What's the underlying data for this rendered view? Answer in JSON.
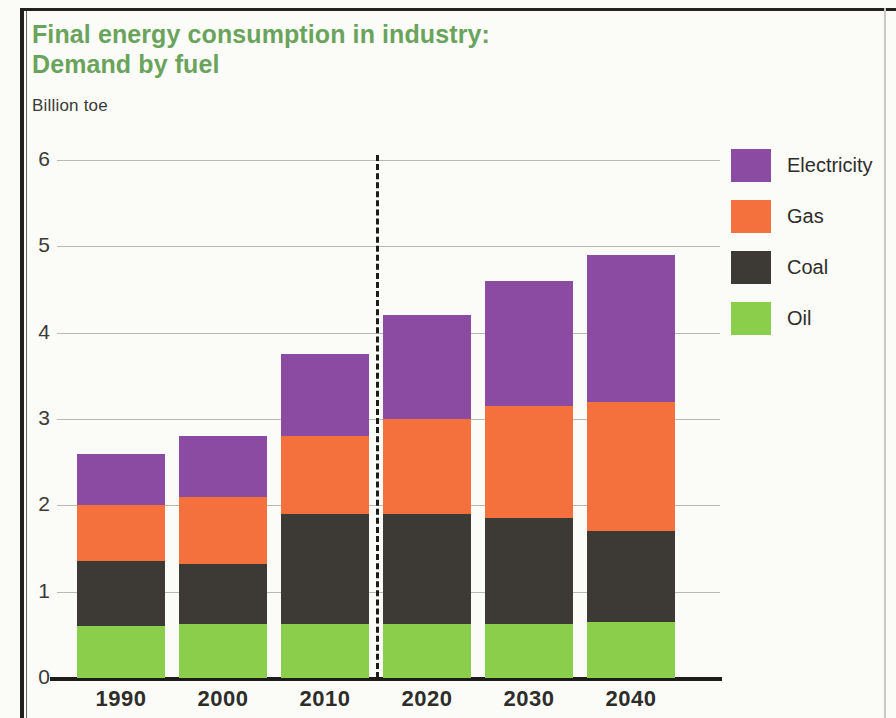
{
  "header": {
    "title_line1": "Final energy consumption in industry:",
    "title_line2": "Demand by fuel",
    "subtitle": "Billion toe",
    "title_color": "#6aa45c"
  },
  "chart_data": {
    "type": "bar",
    "stacked": true,
    "title": "Final energy consumption in industry: Demand by fuel",
    "subtitle": "Billion toe",
    "xlabel": "",
    "ylabel": "Billion toe",
    "ylim": [
      0,
      6
    ],
    "yticks": [
      "0",
      "1",
      "2",
      "3",
      "4",
      "5",
      "6"
    ],
    "grid": true,
    "legend_position": "right",
    "categories": [
      "1990",
      "2000",
      "2010",
      "2020",
      "2030",
      "2040"
    ],
    "series": [
      {
        "name": "Oil",
        "color": "#8ace4b",
        "values": [
          0.6,
          0.62,
          0.62,
          0.62,
          0.62,
          0.65
        ]
      },
      {
        "name": "Coal",
        "color": "#3d3a36",
        "values": [
          0.75,
          0.7,
          1.28,
          1.28,
          1.23,
          1.05
        ]
      },
      {
        "name": "Gas",
        "color": "#f4703c",
        "values": [
          0.65,
          0.78,
          0.9,
          1.1,
          1.3,
          1.5
        ]
      },
      {
        "name": "Electricity",
        "color": "#8c4ba3",
        "values": [
          0.6,
          0.7,
          0.95,
          1.2,
          1.45,
          1.7
        ]
      }
    ],
    "totals": [
      2.6,
      2.8,
      3.75,
      4.2,
      4.6,
      4.9
    ],
    "cumulative_tops": {
      "oil": [
        0.6,
        0.62,
        0.62,
        0.62,
        0.62,
        0.65
      ],
      "coal": [
        1.35,
        1.32,
        1.9,
        1.9,
        1.85,
        1.7
      ],
      "gas": [
        2.0,
        2.1,
        2.8,
        3.0,
        3.15,
        3.2
      ],
      "electricity": [
        2.6,
        2.8,
        3.75,
        4.2,
        4.6,
        4.9
      ]
    },
    "annotations": [
      {
        "type": "vertical-dashed-line",
        "label": "history / projection divider",
        "x_between": [
          "2010",
          "2020"
        ]
      }
    ]
  },
  "legend": {
    "items": [
      {
        "label": "Electricity",
        "color": "#8c4ba3"
      },
      {
        "label": "Gas",
        "color": "#f4703c"
      },
      {
        "label": "Coal",
        "color": "#3d3a36"
      },
      {
        "label": "Oil",
        "color": "#8ace4b"
      }
    ]
  }
}
